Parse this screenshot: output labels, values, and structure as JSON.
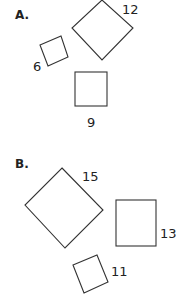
{
  "sections": [
    {
      "label": "A.",
      "shapes": [
        {
          "kind": "rotated-square",
          "side_label": "12"
        },
        {
          "kind": "rotated-square",
          "side_label": "6"
        },
        {
          "kind": "square",
          "side_label": "9"
        }
      ]
    },
    {
      "label": "B.",
      "shapes": [
        {
          "kind": "rotated-square",
          "side_label": "15"
        },
        {
          "kind": "square",
          "side_label": "13"
        },
        {
          "kind": "rotated-square",
          "side_label": "11"
        }
      ]
    }
  ],
  "colors": {
    "stroke": "#333333",
    "text": "#222222",
    "background": "#ffffff"
  }
}
